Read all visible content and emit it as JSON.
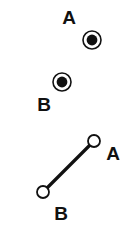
{
  "figure": {
    "background_color": "#ffffff",
    "stroke_color": "#111111",
    "fill_color": "#111111",
    "width": 137,
    "height": 232,
    "panels": [
      {
        "name": "concentric-markers-panel",
        "marker_style": "filled-dot-in-ring",
        "points": [
          {
            "id": "point-a-top",
            "label": "A",
            "marker_cx": 92,
            "marker_cy": 40,
            "outer_r": 10,
            "ring_r": 8,
            "inner_r": 5.5,
            "label_x": 69,
            "label_y": 19
          },
          {
            "id": "point-b-top",
            "label": "B",
            "marker_cx": 62,
            "marker_cy": 82,
            "outer_r": 10,
            "ring_r": 8,
            "inner_r": 5.5,
            "label_x": 44,
            "label_y": 106
          }
        ]
      },
      {
        "name": "segment-panel",
        "marker_style": "hollow-circle",
        "segment": {
          "id": "segment-ab",
          "x1": 43,
          "y1": 192,
          "x2": 94,
          "y2": 141,
          "stroke_width": 3
        },
        "points": [
          {
            "id": "point-a-bottom",
            "label": "A",
            "marker_cx": 94,
            "marker_cy": 141,
            "outer_r": 6.5,
            "label_x": 113,
            "label_y": 155
          },
          {
            "id": "point-b-bottom",
            "label": "B",
            "marker_cx": 43,
            "marker_cy": 192,
            "outer_r": 6.5,
            "label_x": 61,
            "label_y": 215
          }
        ]
      }
    ]
  }
}
